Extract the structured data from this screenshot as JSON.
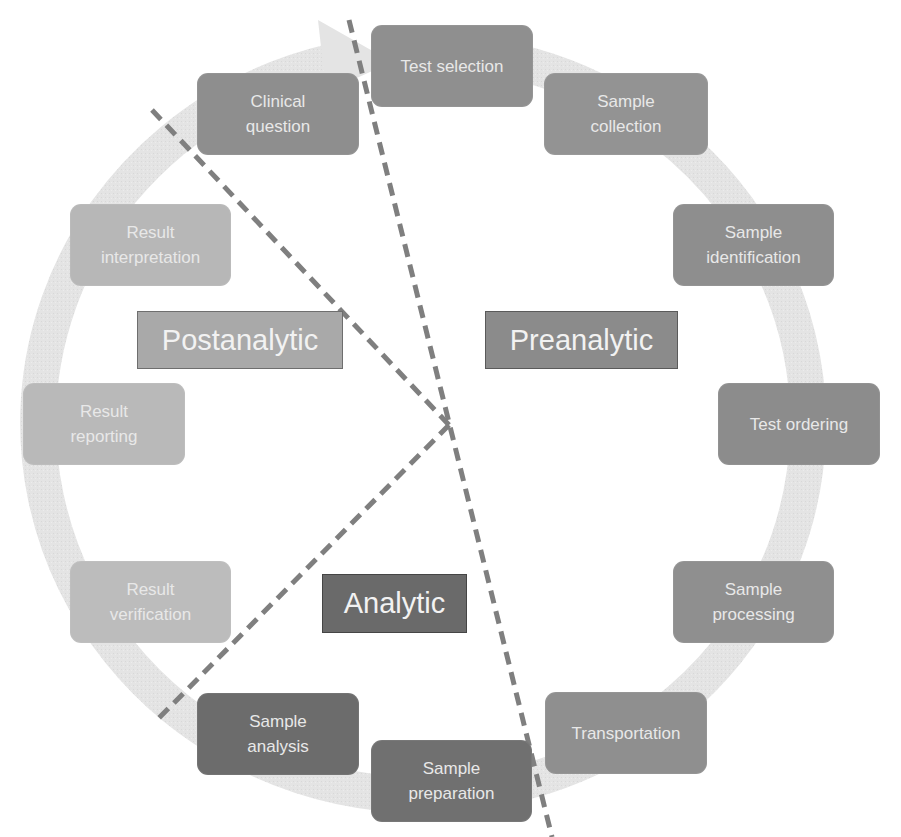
{
  "diagram": {
    "colors": {
      "preanalytic_step": "#8f8f8f",
      "analytic_step": "#6e6e6e",
      "postanalytic_step": "#b8b8b8",
      "ring_arrow": "#e3e3e3",
      "divider": "#808080",
      "preanalytic_label": "#8c8c8c",
      "analytic_label": "#6a6a6a",
      "postanalytic_label": "#a8a8a8"
    },
    "phases": {
      "preanalytic": "Preanalytic",
      "analytic": "Analytic",
      "postanalytic": "Postanalytic"
    },
    "steps": [
      {
        "label": "Test selection",
        "phase": "preanalytic"
      },
      {
        "label": "Sample\ncollection",
        "phase": "preanalytic"
      },
      {
        "label": "Sample\nidentification",
        "phase": "preanalytic"
      },
      {
        "label": "Test ordering",
        "phase": "preanalytic"
      },
      {
        "label": "Sample\nprocessing",
        "phase": "preanalytic"
      },
      {
        "label": "Transportation",
        "phase": "preanalytic"
      },
      {
        "label": "Sample\npreparation",
        "phase": "analytic"
      },
      {
        "label": "Sample\nanalysis",
        "phase": "analytic"
      },
      {
        "label": "Result\nverification",
        "phase": "postanalytic"
      },
      {
        "label": "Result\nreporting",
        "phase": "postanalytic"
      },
      {
        "label": "Result\ninterpretation",
        "phase": "postanalytic"
      },
      {
        "label": "Clinical\nquestion",
        "phase": "preanalytic"
      }
    ]
  }
}
